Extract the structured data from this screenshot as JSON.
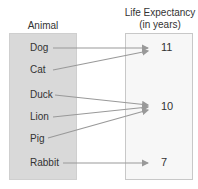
{
  "headers": {
    "domain": "Animal",
    "range_line1": "Life Expectancy",
    "range_line2": "(in years)"
  },
  "domain_items": [
    "Dog",
    "Cat",
    "Duck",
    "Lion",
    "Pig",
    "Rabbit"
  ],
  "range_items": [
    "11",
    "10",
    "7"
  ],
  "mappings": [
    {
      "from": "Dog",
      "to": "11"
    },
    {
      "from": "Cat",
      "to": "11"
    },
    {
      "from": "Duck",
      "to": "10"
    },
    {
      "from": "Lion",
      "to": "10"
    },
    {
      "from": "Pig",
      "to": "10"
    },
    {
      "from": "Rabbit",
      "to": "7"
    }
  ],
  "colors": {
    "arrow": "#999999",
    "left_box": "#d9d9d9",
    "right_box": "#f7f7f7"
  }
}
